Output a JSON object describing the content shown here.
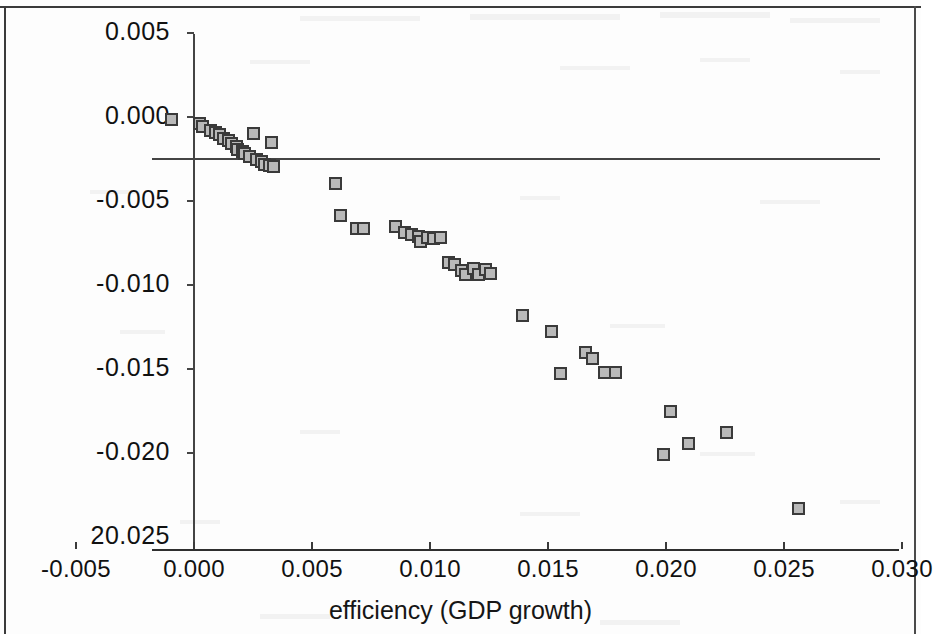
{
  "chart_data": {
    "type": "scatter",
    "title": "",
    "xlabel": "efficiency (GDP growth)",
    "ylabel": "",
    "xlim": [
      -0.005,
      0.03
    ],
    "ylim": [
      -0.025,
      0.005
    ],
    "grid": false,
    "legend": null,
    "x_ticks": [
      "-0.005",
      "0.000",
      "0.005",
      "0.010",
      "0.015",
      "0.020",
      "0.025",
      "0.030"
    ],
    "x_tick_values": [
      -0.005,
      0.0,
      0.005,
      0.01,
      0.015,
      0.02,
      0.025,
      0.03
    ],
    "y_ticks": [
      "0.005",
      "0.000",
      "-0.005",
      "-0.010",
      "-0.015",
      "-0.020",
      "20.025"
    ],
    "y_tick_values": [
      0.005,
      0.0,
      -0.005,
      -0.01,
      -0.015,
      -0.02,
      -0.025
    ],
    "marker": "square",
    "marker_fill": "#b9b9b9",
    "marker_edge": "#3a3a3a",
    "points": [
      [
        -0.00095,
        -0.00015
      ],
      [
        0.00025,
        -0.0004
      ],
      [
        0.00035,
        -0.00055
      ],
      [
        0.0007,
        -0.0008
      ],
      [
        0.0009,
        -0.0009
      ],
      [
        0.0011,
        -0.00105
      ],
      [
        0.00125,
        -0.00125
      ],
      [
        0.00145,
        -0.0014
      ],
      [
        0.0016,
        -0.0016
      ],
      [
        0.0018,
        -0.00175
      ],
      [
        0.00185,
        -0.00195
      ],
      [
        0.00205,
        -0.00205
      ],
      [
        0.00215,
        -0.0022
      ],
      [
        0.00235,
        -0.00235
      ],
      [
        0.0025,
        -0.001
      ],
      [
        0.0033,
        -0.0015
      ],
      [
        0.00265,
        -0.0025
      ],
      [
        0.00285,
        -0.00265
      ],
      [
        0.003,
        -0.0028
      ],
      [
        0.0032,
        -0.0029
      ],
      [
        0.00335,
        -0.00295
      ],
      [
        0.006,
        -0.00395
      ],
      [
        0.0062,
        -0.00585
      ],
      [
        0.0069,
        -0.00665
      ],
      [
        0.0072,
        -0.00665
      ],
      [
        0.00855,
        -0.0065
      ],
      [
        0.0089,
        -0.00685
      ],
      [
        0.0092,
        -0.007
      ],
      [
        0.0095,
        -0.0071
      ],
      [
        0.0096,
        -0.0074
      ],
      [
        0.0099,
        -0.0072
      ],
      [
        0.01015,
        -0.00725
      ],
      [
        0.01045,
        -0.0072
      ],
      [
        0.0108,
        -0.00865
      ],
      [
        0.01105,
        -0.0088
      ],
      [
        0.01135,
        -0.00915
      ],
      [
        0.0115,
        -0.00935
      ],
      [
        0.01185,
        -0.009
      ],
      [
        0.01205,
        -0.0094
      ],
      [
        0.01235,
        -0.00905
      ],
      [
        0.01255,
        -0.0093
      ],
      [
        0.0139,
        -0.0118
      ],
      [
        0.01515,
        -0.01275
      ],
      [
        0.0166,
        -0.014
      ],
      [
        0.0169,
        -0.0144
      ],
      [
        0.01555,
        -0.01525
      ],
      [
        0.0174,
        -0.0152
      ],
      [
        0.01785,
        -0.0152
      ],
      [
        0.0202,
        -0.01755
      ],
      [
        0.02095,
        -0.01945
      ],
      [
        0.02255,
        -0.0188
      ],
      [
        0.0199,
        -0.0201
      ],
      [
        0.0256,
        -0.0233
      ]
    ],
    "n_points": 53
  },
  "axis": {
    "x_title": "efficiency (GDP growth)"
  }
}
